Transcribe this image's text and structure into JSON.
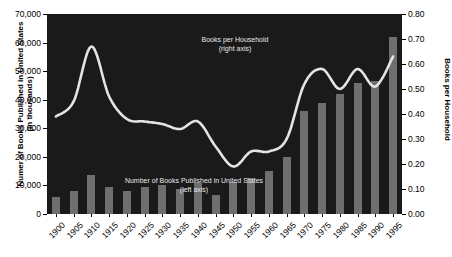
{
  "chart_data": {
    "type": "bar",
    "title": "",
    "xlabel": "",
    "categories": [
      "1900",
      "1905",
      "1910",
      "1915",
      "1920",
      "1925",
      "1930",
      "1935",
      "1940",
      "1945",
      "1950",
      "1955",
      "1960",
      "1965",
      "1970",
      "1975",
      "1980",
      "1985",
      "1990",
      "1995"
    ],
    "grid": false,
    "legend_position": "inline-annotation",
    "series": [
      {
        "name": "Number of Books Published in United States",
        "type": "bar",
        "axis": "left",
        "unit": "thousands",
        "color": "#6e6e6e",
        "values": [
          6000,
          7900,
          13500,
          9500,
          8200,
          9400,
          10000,
          8600,
          11000,
          6500,
          11200,
          12500,
          15000,
          20000,
          36000,
          39000,
          42000,
          46000,
          46500,
          62000
        ]
      },
      {
        "name": "Books per Household",
        "type": "line",
        "axis": "right",
        "color": "#e4e4e4",
        "values": [
          0.39,
          0.45,
          0.67,
          0.47,
          0.38,
          0.37,
          0.36,
          0.34,
          0.37,
          0.27,
          0.19,
          0.25,
          0.25,
          0.3,
          0.52,
          0.58,
          0.5,
          0.58,
          0.51,
          0.63
        ]
      }
    ],
    "left_axis": {
      "label": "Numer of Books Published in United States (in thousands)",
      "label_line1": "Numer of Books Published in United States",
      "label_line2": "(in thousands)",
      "min": 0,
      "max": 70000,
      "ticks": [
        "0",
        "10,000",
        "20,000",
        "30,000",
        "40,000",
        "50,000",
        "60,000",
        "70,000"
      ],
      "tick_values": [
        0,
        10000,
        20000,
        30000,
        40000,
        50000,
        60000,
        70000
      ]
    },
    "right_axis": {
      "label": "Books per Household",
      "min": 0,
      "max": 0.8,
      "ticks": [
        "0.00",
        "0.10",
        "0.20",
        "0.30",
        "0.40",
        "0.50",
        "0.60",
        "0.70",
        "0.80"
      ],
      "tick_values": [
        0,
        0.1,
        0.2,
        0.3,
        0.4,
        0.5,
        0.6,
        0.7,
        0.8
      ]
    },
    "annotations": [
      {
        "id": "line-series",
        "line1": "Books per Household",
        "line2": "(right axis)"
      },
      {
        "id": "bar-series",
        "line1": "Number of Books Published in United States",
        "line2": "(left axis)"
      }
    ],
    "plot_background": "#1a1a1a",
    "page_background": "#ffffff"
  }
}
